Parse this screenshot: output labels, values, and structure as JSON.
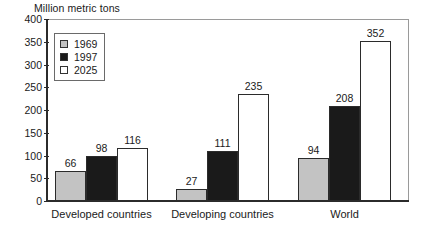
{
  "chart_data": {
    "type": "bar",
    "title": "",
    "ylabel": "Million metric tons",
    "xlabel": "",
    "ylim": [
      0,
      400
    ],
    "yticks": [
      0,
      50,
      100,
      150,
      200,
      250,
      300,
      350,
      400
    ],
    "grid": false,
    "legend_position": "top-left",
    "categories": [
      "Developed countries",
      "Developing countries",
      "World"
    ],
    "series": [
      {
        "name": "1969",
        "color": "#c3c3c3",
        "values": [
          66,
          27,
          94
        ]
      },
      {
        "name": "1997",
        "color": "#1a1a1a",
        "values": [
          98,
          111,
          208
        ]
      },
      {
        "name": "2025",
        "color": "#ffffff",
        "values": [
          116,
          235,
          352
        ]
      }
    ]
  },
  "axis": {
    "y_title": "Million metric tons",
    "y_labels": [
      "400",
      "350",
      "300",
      "250",
      "200",
      "150",
      "100",
      "50",
      "0"
    ]
  },
  "legend": {
    "items": [
      {
        "label": "1969"
      },
      {
        "label": "1997"
      },
      {
        "label": "2025"
      }
    ]
  },
  "groups": [
    {
      "label": "Developed countries",
      "bars": [
        {
          "series": "1969",
          "value": "66"
        },
        {
          "series": "1997",
          "value": "98"
        },
        {
          "series": "2025",
          "value": "116"
        }
      ]
    },
    {
      "label": "Developing countries",
      "bars": [
        {
          "series": "1969",
          "value": "27"
        },
        {
          "series": "1997",
          "value": "111"
        },
        {
          "series": "2025",
          "value": "235"
        }
      ]
    },
    {
      "label": "World",
      "bars": [
        {
          "series": "1969",
          "value": "94"
        },
        {
          "series": "1997",
          "value": "208"
        },
        {
          "series": "2025",
          "value": "352"
        }
      ]
    }
  ],
  "colors": {
    "series_1969": "#c3c3c3",
    "series_1997": "#1a1a1a",
    "series_2025": "#ffffff",
    "axis": "#2b2b2b",
    "frame": "#8a8a8a"
  }
}
